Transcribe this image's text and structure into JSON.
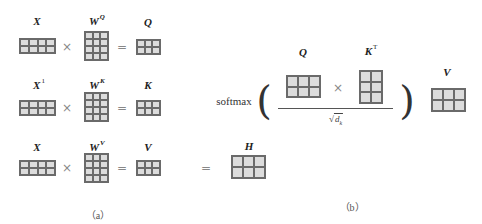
{
  "part_a": {
    "caption": "（a）",
    "rows": [
      {
        "input_label": "X",
        "input_sup": "",
        "weight_label": "W",
        "weight_sup": "Q",
        "output_label": "Q",
        "times": "×",
        "equals": "="
      },
      {
        "input_label": "X",
        "input_sup": "1",
        "weight_label": "W",
        "weight_sup": "K",
        "output_label": "K",
        "times": "×",
        "equals": "="
      },
      {
        "input_label": "X",
        "input_sup": "",
        "weight_label": "W",
        "weight_sup": "V",
        "output_label": "V",
        "times": "×",
        "equals": "="
      }
    ],
    "result": {
      "equals": "=",
      "label": "H"
    }
  },
  "part_b": {
    "caption": "（b）",
    "softmax": "softmax",
    "left_paren": "(",
    "right_paren": ")",
    "q_label": "Q",
    "k_label": "K",
    "k_sup": "T",
    "times": "×",
    "sqrt_symbol": "√",
    "denominator_var": "d",
    "denominator_sub": "k",
    "v_label": "V"
  },
  "matrices": {
    "X": {
      "rows": 2,
      "cols": 4
    },
    "W": {
      "rows": 4,
      "cols": 3
    },
    "QKV": {
      "rows": 2,
      "cols": 3
    },
    "H": {
      "rows": 2,
      "cols": 3
    },
    "KT": {
      "rows": 3,
      "cols": 2
    }
  }
}
